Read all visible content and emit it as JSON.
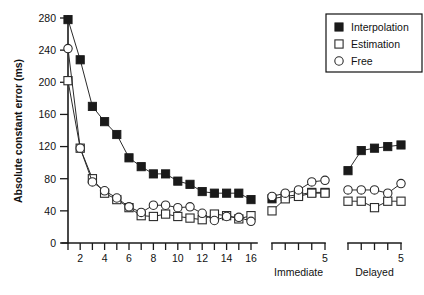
{
  "chart_data": {
    "type": "line",
    "title": "",
    "xlabel": "",
    "ylabel": "Absolute constant error (ms)",
    "ylim": [
      0,
      280
    ],
    "yticks": [
      0,
      40,
      80,
      120,
      160,
      200,
      240,
      280
    ],
    "grid": false,
    "legend_position": "top-right",
    "axes": [
      {
        "name": "acquisition",
        "label": "",
        "x": [
          1,
          2,
          3,
          4,
          5,
          6,
          7,
          8,
          9,
          10,
          11,
          12,
          13,
          14,
          15,
          16
        ],
        "xticklabels": [
          "",
          "2",
          "",
          "4",
          "",
          "6",
          "",
          "8",
          "",
          "10",
          "",
          "12",
          "",
          "14",
          "",
          "16"
        ]
      },
      {
        "name": "immediate",
        "label": "Immediate",
        "x": [
          1,
          2,
          3,
          4,
          5
        ],
        "xticklabels": [
          "",
          "",
          "",
          "",
          "5"
        ]
      },
      {
        "name": "delayed",
        "label": "Delayed",
        "x": [
          1,
          2,
          3,
          4,
          5
        ],
        "xticklabels": [
          "",
          "",
          "",
          "",
          "5"
        ]
      }
    ],
    "series": [
      {
        "name": "Interpolation",
        "marker": "filled-square",
        "color": "#1a1a1a",
        "acquisition": [
          278,
          228,
          170,
          151,
          135,
          106,
          95,
          86,
          86,
          77,
          73,
          64,
          62,
          62,
          62,
          54
        ],
        "immediate": [
          55,
          58,
          60,
          63,
          63
        ],
        "delayed": [
          90,
          115,
          118,
          120,
          122
        ]
      },
      {
        "name": "Estimation",
        "marker": "open-square",
        "color": "#2b2b2b",
        "acquisition": [
          202,
          118,
          80,
          62,
          54,
          44,
          34,
          33,
          36,
          33,
          31,
          29,
          36,
          34,
          30,
          34
        ],
        "immediate": [
          40,
          55,
          58,
          62,
          62
        ],
        "delayed": [
          52,
          52,
          44,
          52,
          52
        ]
      },
      {
        "name": "Free",
        "marker": "open-circle",
        "color": "#2b2b2b",
        "acquisition": [
          242,
          118,
          76,
          65,
          56,
          45,
          38,
          47,
          47,
          44,
          45,
          37,
          28,
          33,
          32,
          27
        ],
        "immediate": [
          58,
          62,
          66,
          76,
          78
        ],
        "delayed": [
          66,
          66,
          66,
          62,
          74
        ]
      }
    ],
    "legend": [
      {
        "label": "Interpolation",
        "marker": "filled-square"
      },
      {
        "label": "Estimation",
        "marker": "open-square"
      },
      {
        "label": "Free",
        "marker": "open-circle"
      }
    ]
  }
}
